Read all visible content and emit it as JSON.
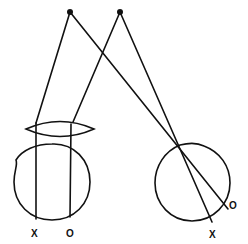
{
  "diagram": {
    "type": "optics-eye-projection",
    "colors": {
      "ink": "#111111",
      "background": "#ffffff"
    },
    "points": {
      "left_object": {
        "x": 70,
        "y": 12
      },
      "right_object": {
        "x": 120,
        "y": 12
      }
    },
    "left_eye": {
      "lens": {
        "cx": 60,
        "cy": 129,
        "rx": 34,
        "ry": 7
      },
      "globe": {
        "cx": 52,
        "cy": 182,
        "r": 38
      },
      "labels": {
        "x_label": "X",
        "o_label": "O"
      }
    },
    "right_eye": {
      "globe": {
        "cx": 192,
        "cy": 183,
        "r": 38
      },
      "nodal_point": {
        "x": 180,
        "y": 145
      },
      "labels": {
        "x_label": "X",
        "o_label": "O"
      }
    }
  }
}
